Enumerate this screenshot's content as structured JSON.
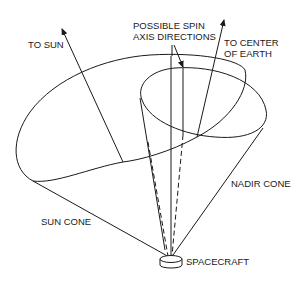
{
  "diagram": {
    "labels": {
      "to_sun": "TO SUN",
      "spin_axis_line1": "POSSIBLE SPIN",
      "spin_axis_line2": "AXIS DIRECTIONS",
      "to_earth_line1": "TO CENTER",
      "to_earth_line2": "OF EARTH",
      "nadir_cone": "NADIR CONE",
      "sun_cone": "SUN CONE",
      "spacecraft": "SPACECRAFT"
    },
    "colors": {
      "stroke": "#1a1a1a",
      "background": "#ffffff"
    }
  }
}
